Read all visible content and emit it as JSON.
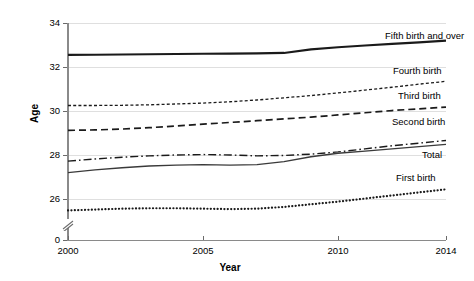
{
  "chart_data": {
    "type": "line",
    "title": "",
    "xlabel": "Year",
    "ylabel": "Age",
    "x": [
      2000,
      2001,
      2002,
      2003,
      2004,
      2005,
      2006,
      2007,
      2008,
      2009,
      2010,
      2011,
      2012,
      2013,
      2014
    ],
    "xlim": [
      2000,
      2014
    ],
    "xticks": [
      2000,
      2005,
      2010,
      2014
    ],
    "xtick_labels": [
      "2000",
      "2005",
      "2010",
      "2014"
    ],
    "ylim": [
      25.2,
      34
    ],
    "yticks": [
      0,
      26,
      28,
      30,
      32,
      34
    ],
    "ytick_labels": [
      "0",
      "26",
      "28",
      "30",
      "32",
      "34"
    ],
    "y_axis_break": true,
    "y_axis_break_note": "axis broken between 0 and 26",
    "grid": true,
    "grid_axis": "y",
    "legend_position": "inline-right-of-series",
    "series": [
      {
        "name": "Fifth birth and over",
        "line_style": "solid-thick",
        "color": "#1a1a1a",
        "values": [
          32.55,
          32.56,
          32.57,
          32.58,
          32.59,
          32.6,
          32.61,
          32.62,
          32.64,
          32.8,
          32.9,
          32.98,
          33.05,
          33.12,
          33.2
        ]
      },
      {
        "name": "Fourth birth",
        "line_style": "fine-dashed",
        "color": "#1a1a1a",
        "values": [
          30.25,
          30.25,
          30.26,
          30.28,
          30.32,
          30.36,
          30.42,
          30.5,
          30.6,
          30.7,
          30.82,
          30.95,
          31.08,
          31.22,
          31.35
        ]
      },
      {
        "name": "Third birth",
        "line_style": "long-dashed",
        "color": "#1a1a1a",
        "values": [
          29.12,
          29.14,
          29.18,
          29.24,
          29.32,
          29.4,
          29.48,
          29.56,
          29.64,
          29.72,
          29.82,
          29.92,
          30.02,
          30.1,
          30.18
        ]
      },
      {
        "name": "Second birth",
        "line_style": "dash-dot",
        "color": "#1a1a1a",
        "values": [
          27.72,
          27.82,
          27.9,
          27.96,
          28.0,
          28.02,
          28.0,
          27.96,
          27.98,
          28.04,
          28.14,
          28.28,
          28.42,
          28.54,
          28.66
        ]
      },
      {
        "name": "Total",
        "line_style": "solid-thin",
        "color": "#3a3a3a",
        "values": [
          27.2,
          27.32,
          27.42,
          27.5,
          27.54,
          27.56,
          27.54,
          27.56,
          27.7,
          27.92,
          28.08,
          28.18,
          28.28,
          28.38,
          28.48
        ]
      },
      {
        "name": "First birth",
        "line_style": "dotted-thick",
        "color": "#1a1a1a",
        "values": [
          25.48,
          25.52,
          25.56,
          25.58,
          25.58,
          25.56,
          25.54,
          25.56,
          25.64,
          25.76,
          25.88,
          26.02,
          26.16,
          26.3,
          26.44
        ]
      }
    ],
    "series_labels": [
      {
        "text": "Fifth birth and over",
        "x": 385,
        "y": 36
      },
      {
        "text": "Fourth birth",
        "x": 393,
        "y": 71
      },
      {
        "text": "Third birth",
        "x": 398,
        "y": 96
      },
      {
        "text": "Second birth",
        "x": 392,
        "y": 122
      },
      {
        "text": "Total",
        "x": 422,
        "y": 155
      },
      {
        "text": "First birth",
        "x": 396,
        "y": 178
      }
    ]
  }
}
